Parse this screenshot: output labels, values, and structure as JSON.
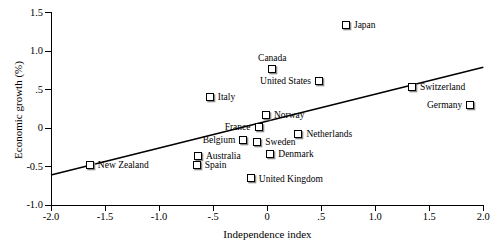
{
  "chart_data": {
    "type": "scatter",
    "title": "",
    "xlabel": "Independence index",
    "ylabel": "Economic growth (%)",
    "xlim": [
      -2.0,
      2.0
    ],
    "ylim": [
      -1.0,
      1.5
    ],
    "grid": false,
    "legend": null,
    "xticks": [
      "-2.0",
      "-1.5",
      "-1.0",
      "-.5",
      "0",
      ".5",
      "1.0",
      "1.5",
      "2.0"
    ],
    "xtick_values": [
      -2.0,
      -1.5,
      -1.0,
      -0.5,
      0,
      0.5,
      1.0,
      1.5,
      2.0
    ],
    "yticks": [
      "-1.0",
      "-0.5",
      "0",
      ".5",
      "1.0",
      "1.5"
    ],
    "ytick_values": [
      -1.0,
      -0.5,
      0,
      0.5,
      1.0,
      1.5
    ],
    "marker": "open-square",
    "points": [
      {
        "label": "Japan",
        "x": 0.72,
        "y": 1.33,
        "label_side": "right"
      },
      {
        "label": "Canada",
        "x": 0.02,
        "y": 0.75,
        "label_side": "above"
      },
      {
        "label": "United States",
        "x": 0.48,
        "y": 0.6,
        "label_side": "left"
      },
      {
        "label": "Switzerland",
        "x": 1.33,
        "y": 0.52,
        "label_side": "right"
      },
      {
        "label": "Germany",
        "x": 1.88,
        "y": 0.29,
        "label_side": "left"
      },
      {
        "label": "Italy",
        "x": -0.54,
        "y": 0.39,
        "label_side": "right"
      },
      {
        "label": "Norway",
        "x": -0.02,
        "y": 0.16,
        "label_side": "right"
      },
      {
        "label": "France",
        "x": -0.08,
        "y": 0.0,
        "label_side": "left"
      },
      {
        "label": "Netherlands",
        "x": 0.28,
        "y": -0.09,
        "label_side": "right"
      },
      {
        "label": "Belgium",
        "x": -0.22,
        "y": -0.17,
        "label_side": "left"
      },
      {
        "label": "Sweden",
        "x": -0.1,
        "y": -0.2,
        "label_side": "right"
      },
      {
        "label": "Denmark",
        "x": 0.02,
        "y": -0.35,
        "label_side": "right"
      },
      {
        "label": "Australia",
        "x": -0.65,
        "y": -0.38,
        "label_side": "right"
      },
      {
        "label": "Spain",
        "x": -0.66,
        "y": -0.49,
        "label_side": "right"
      },
      {
        "label": "New Zealand",
        "x": -1.65,
        "y": -0.49,
        "label_side": "right"
      },
      {
        "label": "United Kingdom",
        "x": -0.16,
        "y": -0.67,
        "label_side": "right"
      }
    ],
    "trend_line": {
      "x_start": -2.0,
      "y_start": -0.61,
      "x_end": 2.0,
      "y_end": 0.79,
      "color": "#000000"
    }
  },
  "caption_sliver": ""
}
